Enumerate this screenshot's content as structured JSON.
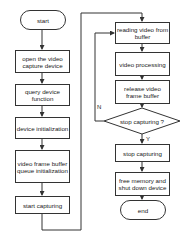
{
  "left_column": {
    "start": "start",
    "steps": [
      "open the video capture device",
      "query device function",
      "device initialization",
      "video frame buffer queue initialization",
      "start capturing"
    ]
  },
  "right_column": {
    "steps": [
      "reading video from buffer",
      "video processing",
      "release video frame buffer"
    ],
    "decision": "stop capturing ?",
    "decision_no": "N",
    "decision_yes": "Y",
    "after_steps": [
      "stop capturing",
      "free memory and shut down device"
    ],
    "end": "end"
  },
  "colors": {
    "line": "#333333",
    "background": "#ffffff"
  }
}
